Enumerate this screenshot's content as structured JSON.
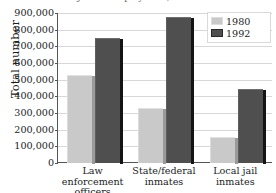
{
  "chart_data": {
    "type": "bar",
    "title": "Criminal justice employment, 1980 and 1992",
    "xlabel": "",
    "ylabel": "Total number",
    "ylim": [
      0,
      900000
    ],
    "ytick_step": 100000,
    "grid": true,
    "legend_position": "top-right",
    "categories": [
      "Law enforcement officers",
      "State/federal inmates",
      "Local jail inmates"
    ],
    "category_lines": [
      [
        "Law",
        "enforcement",
        "officers"
      ],
      [
        "State/federal",
        "inmates"
      ],
      [
        "Local jail",
        "inmates"
      ]
    ],
    "ytick_labels": [
      "900,000",
      "800,000",
      "700,000",
      "600,000",
      "500,000",
      "400,000",
      "300,000",
      "200,000",
      "100,000",
      "0"
    ],
    "ytick_values": [
      900000,
      800000,
      700000,
      600000,
      500000,
      400000,
      300000,
      200000,
      100000,
      0
    ],
    "series": [
      {
        "name": "1980",
        "color": "#c9c9c9",
        "values": [
          530000,
          330000,
          158000
        ]
      },
      {
        "name": "1992",
        "color": "#4f4f4f",
        "values": [
          750000,
          875000,
          447000
        ]
      }
    ]
  },
  "legend": {
    "items": [
      {
        "label": "1980"
      },
      {
        "label": "1992"
      }
    ]
  }
}
